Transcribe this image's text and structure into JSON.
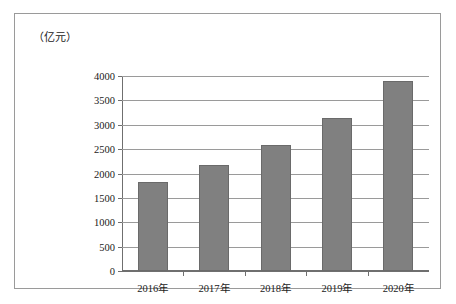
{
  "chart_data": {
    "type": "bar",
    "title": "",
    "subtitle": "",
    "xlabel": "",
    "ylabel": "（亿元）",
    "unit_caption": "（亿元）",
    "categories": [
      "2016年",
      "2017年",
      "2018年",
      "2019年",
      "2020年"
    ],
    "values": [
      1835,
      2165,
      2580,
      3130,
      3890
    ],
    "series": [
      {
        "name": "",
        "values": [
          1835,
          2165,
          2580,
          3130,
          3890
        ]
      }
    ],
    "ylim": [
      0,
      4000
    ],
    "yticks": [
      0,
      500,
      1000,
      1500,
      2000,
      2500,
      3000,
      3500,
      4000
    ],
    "ytick_labels": [
      "0",
      "500",
      "1000",
      "1500",
      "2000",
      "2500",
      "3000",
      "3500",
      "4000"
    ],
    "grid": true,
    "grid_axis": "y",
    "legend": false,
    "legend_position": "none",
    "bar_color": "#808080",
    "bar_edge_color": "#6a6a6a",
    "axis_color": "#6f6f6f",
    "grid_color": "#9a9a9a",
    "border_color": "#9a9a9a",
    "background": "#ffffff",
    "data_labels": false
  }
}
